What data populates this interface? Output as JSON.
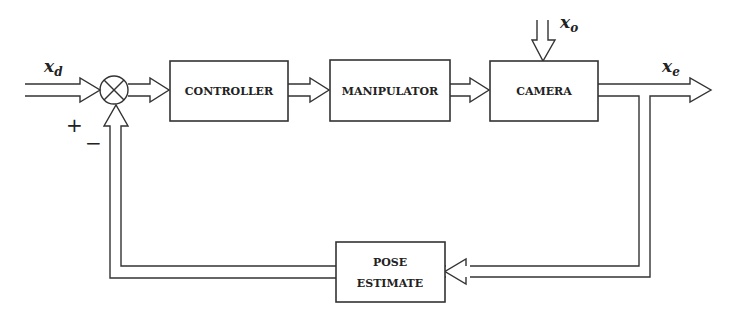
{
  "diagram": {
    "type": "block-diagram",
    "title": "",
    "signals": {
      "reference": {
        "symbol": "x",
        "subscript": "d"
      },
      "disturbance": {
        "symbol": "x",
        "subscript": "o"
      },
      "output": {
        "symbol": "x",
        "subscript": "e"
      }
    },
    "summing_junction": {
      "plus_sign": "+",
      "minus_sign": "−"
    },
    "blocks": [
      {
        "id": "controller",
        "lines": [
          "CONTROLLER"
        ]
      },
      {
        "id": "manipulator",
        "lines": [
          "MANIPULATOR"
        ]
      },
      {
        "id": "camera",
        "lines": [
          "CAMERA"
        ]
      },
      {
        "id": "pose_estimate",
        "lines": [
          "POSE",
          "ESTIMATE"
        ]
      }
    ],
    "connections": [
      {
        "from": "x_d",
        "to": "summing_junction",
        "sign": "+"
      },
      {
        "from": "summing_junction",
        "to": "controller"
      },
      {
        "from": "controller",
        "to": "manipulator"
      },
      {
        "from": "manipulator",
        "to": "camera"
      },
      {
        "from": "x_o",
        "to": "camera"
      },
      {
        "from": "camera",
        "to": "x_e"
      },
      {
        "from": "camera",
        "to": "pose_estimate"
      },
      {
        "from": "pose_estimate",
        "to": "summing_junction",
        "sign": "-"
      }
    ]
  }
}
